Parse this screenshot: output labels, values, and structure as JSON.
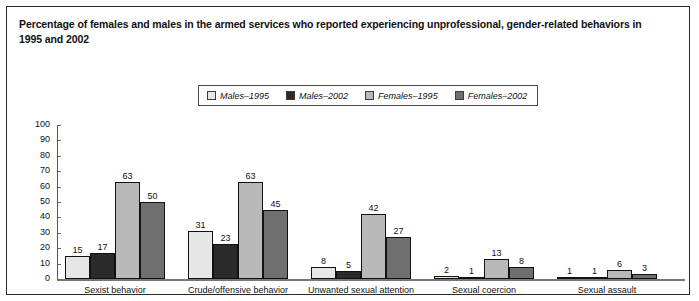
{
  "title": "Percentage of females and males in the armed services who reported experiencing unprofessional, gender-related behaviors in 1995 and 2002",
  "legend": {
    "items": [
      {
        "label": "Males–1995",
        "color": "#e6e6e6"
      },
      {
        "label": "Males–2002",
        "color": "#2a2a2a"
      },
      {
        "label": "Females–1995",
        "color": "#b9b9b9"
      },
      {
        "label": "Females–2002",
        "color": "#6f6f6f"
      }
    ]
  },
  "chart_data": {
    "type": "bar",
    "title": "Percentage of females and males in the armed services who reported experiencing unprofessional, gender-related behaviors in 1995 and 2002",
    "xlabel": "",
    "ylabel": "",
    "ylim": [
      0,
      100
    ],
    "yticks": [
      0,
      10,
      20,
      30,
      40,
      50,
      60,
      70,
      80,
      90,
      100
    ],
    "grid": false,
    "legend_position": "top-center",
    "categories": [
      "Sexist behavior",
      "Crude/offensive behavior",
      "Unwanted sexual attention",
      "Sexual coercion",
      "Sexual assault"
    ],
    "series": [
      {
        "name": "Males–1995",
        "color": "#e6e6e6",
        "values": [
          15,
          31,
          8,
          2,
          1
        ]
      },
      {
        "name": "Males–2002",
        "color": "#2a2a2a",
        "values": [
          17,
          23,
          5,
          1,
          1
        ]
      },
      {
        "name": "Females–1995",
        "color": "#b9b9b9",
        "values": [
          63,
          63,
          42,
          13,
          6
        ]
      },
      {
        "name": "Females–2002",
        "color": "#6f6f6f",
        "values": [
          50,
          45,
          27,
          8,
          3
        ]
      }
    ]
  }
}
